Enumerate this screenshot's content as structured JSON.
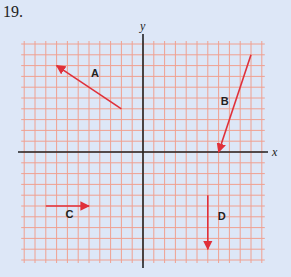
{
  "problem_number": "19.",
  "axes": {
    "x_label": "x",
    "y_label": "y"
  },
  "grid": {
    "cells_left": 11,
    "cells_right": 11,
    "cells_up": 10,
    "cells_down": 10,
    "line_color": "#f0a090",
    "axis_color": "#222222"
  },
  "vector_color": "#e0303a",
  "vectors": [
    {
      "label": "A",
      "tail": [
        -2,
        4
      ],
      "head": [
        -8,
        8
      ]
    },
    {
      "label": "B",
      "tail": [
        10,
        9
      ],
      "head": [
        7,
        0
      ]
    },
    {
      "label": "C",
      "tail": [
        -9,
        -5
      ],
      "head": [
        -5,
        -5
      ]
    },
    {
      "label": "D",
      "tail": [
        6,
        -4
      ],
      "head": [
        6,
        -9
      ]
    }
  ]
}
